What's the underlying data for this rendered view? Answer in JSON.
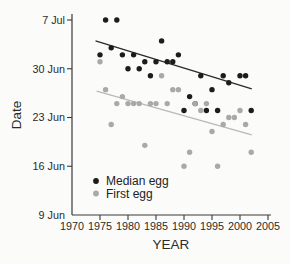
{
  "figure": {
    "background_color": "#fbfbfa",
    "axis_color": "#3a3a3a",
    "text_color": "#2b2b2b"
  },
  "chart_data": {
    "type": "scatter",
    "title": "",
    "xlabel": "YEAR",
    "ylabel": "Date",
    "x_ticks": [
      1970,
      1975,
      1980,
      1985,
      1990,
      1995,
      2000,
      2005
    ],
    "y_ticks": [
      "9 Jun",
      "16 Jun",
      "23 Jun",
      "30 Jun",
      "7 Jul"
    ],
    "xlim": [
      1970,
      2005.7
    ],
    "ylim": [
      "9 Jun",
      "8 Jul"
    ],
    "grid": false,
    "legend": {
      "position": "inside-lower-left",
      "entries": [
        {
          "label": "Median egg",
          "color": "#1c1c1c"
        },
        {
          "label": "First egg",
          "color": "#a9a9a9"
        }
      ]
    },
    "series": [
      {
        "name": "Median egg",
        "marker": "circle",
        "color": "#1c1c1c",
        "points": [
          {
            "year": 1975,
            "date": "2 Jul"
          },
          {
            "year": 1976,
            "date": "7 Jul"
          },
          {
            "year": 1977,
            "date": "3 Jul"
          },
          {
            "year": 1978,
            "date": "7 Jul"
          },
          {
            "year": 1979,
            "date": "2 Jul"
          },
          {
            "year": 1980,
            "date": "30 Jun"
          },
          {
            "year": 1981,
            "date": "2 Jul"
          },
          {
            "year": 1982,
            "date": "30 Jun"
          },
          {
            "year": 1983,
            "date": "1 Jul"
          },
          {
            "year": 1984,
            "date": "29 Jun"
          },
          {
            "year": 1985,
            "date": "1 Jul"
          },
          {
            "year": 1986,
            "date": "4 Jul"
          },
          {
            "year": 1987,
            "date": "1 Jul"
          },
          {
            "year": 1988,
            "date": "1 Jul"
          },
          {
            "year": 1989,
            "date": "2 Jul"
          },
          {
            "year": 1990,
            "date": "24 Jun"
          },
          {
            "year": 1991,
            "date": "26 Jun"
          },
          {
            "year": 1992,
            "date": "25 Jun"
          },
          {
            "year": 1993,
            "date": "29 Jun"
          },
          {
            "year": 1994,
            "date": "24 Jun"
          },
          {
            "year": 1995,
            "date": "27 Jun"
          },
          {
            "year": 1996,
            "date": "24 Jun"
          },
          {
            "year": 1997,
            "date": "29 Jun"
          },
          {
            "year": 1998,
            "date": "28 Jun"
          },
          {
            "year": 2000,
            "date": "29 Jun"
          },
          {
            "year": 2001,
            "date": "29 Jun"
          },
          {
            "year": 2002,
            "date": "24 Jun"
          }
        ]
      },
      {
        "name": "First egg",
        "marker": "circle",
        "color": "#a9a9a9",
        "points": [
          {
            "year": 1975,
            "date": "1 Jul"
          },
          {
            "year": 1976,
            "date": "27 Jun"
          },
          {
            "year": 1977,
            "date": "22 Jun"
          },
          {
            "year": 1978,
            "date": "25 Jun"
          },
          {
            "year": 1979,
            "date": "26 Jun"
          },
          {
            "year": 1980,
            "date": "25 Jun"
          },
          {
            "year": 1981,
            "date": "25 Jun"
          },
          {
            "year": 1982,
            "date": "25 Jun"
          },
          {
            "year": 1983,
            "date": "19 Jun"
          },
          {
            "year": 1984,
            "date": "25 Jun"
          },
          {
            "year": 1985,
            "date": "25 Jun"
          },
          {
            "year": 1986,
            "date": "29 Jun"
          },
          {
            "year": 1987,
            "date": "25 Jun"
          },
          {
            "year": 1988,
            "date": "27 Jun"
          },
          {
            "year": 1989,
            "date": "27 Jun"
          },
          {
            "year": 1990,
            "date": "16 Jun"
          },
          {
            "year": 1991,
            "date": "18 Jun"
          },
          {
            "year": 1992,
            "date": "25 Jun"
          },
          {
            "year": 1993,
            "date": "24 Jun"
          },
          {
            "year": 1994,
            "date": "25 Jun"
          },
          {
            "year": 1995,
            "date": "21 Jun"
          },
          {
            "year": 1996,
            "date": "16 Jun"
          },
          {
            "year": 1997,
            "date": "22 Jun"
          },
          {
            "year": 1998,
            "date": "23 Jun"
          },
          {
            "year": 1999,
            "date": "23 Jun"
          },
          {
            "year": 2000,
            "date": "24 Jun"
          },
          {
            "year": 2001,
            "date": "22 Jun"
          },
          {
            "year": 2002,
            "date": "18 Jun"
          }
        ]
      }
    ],
    "trend_lines": [
      {
        "series": "Median egg",
        "color": "#2a2a2a",
        "from": {
          "year": 1974.2,
          "days_after_9jun": 25.0
        },
        "to": {
          "year": 2002.1,
          "days_after_9jun": 18.1
        }
      },
      {
        "series": "First egg",
        "color": "#b9b9b9",
        "from": {
          "year": 1974.4,
          "days_after_9jun": 17.8
        },
        "to": {
          "year": 2002.1,
          "days_after_9jun": 11.5
        }
      }
    ]
  }
}
